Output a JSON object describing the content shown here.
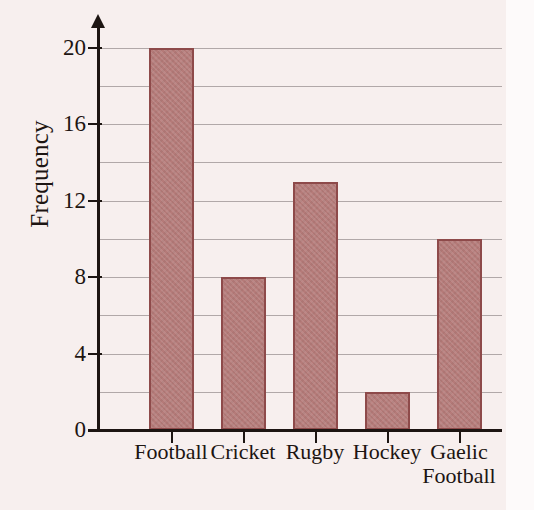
{
  "chart_data": {
    "type": "bar",
    "title": "",
    "xlabel": "",
    "ylabel": "Frequency",
    "categories": [
      "Football",
      "Cricket",
      "Rugby",
      "Hockey",
      "Gaelic\nFootball"
    ],
    "values": [
      20,
      8,
      13,
      2,
      10
    ],
    "ylim": [
      0,
      20
    ],
    "y_tick_labels": [
      "0",
      "4",
      "8",
      "12",
      "16",
      "20"
    ],
    "y_tick_values": [
      0,
      4,
      8,
      12,
      16,
      20
    ],
    "y_major_step": 4,
    "y_minor_step": 2,
    "gridlines": [
      0,
      2,
      4,
      6,
      8,
      10,
      12,
      14,
      16,
      18,
      20
    ],
    "grid": true,
    "legend": "none",
    "colors": {
      "bar_fill": "#b57b79",
      "bar_border": "#8e4a4a",
      "axis": "#1d1512",
      "gridline": "#9a9090",
      "background": "#f7efee"
    }
  }
}
